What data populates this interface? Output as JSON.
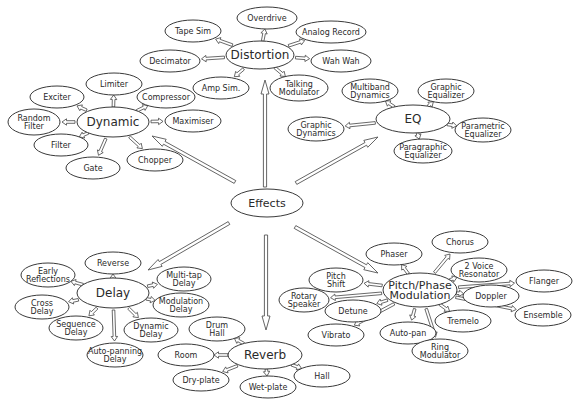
{
  "diagram": {
    "root": {
      "id": "effects",
      "label": "Effects",
      "cx": 267,
      "cy": 203,
      "rx": 36,
      "ry": 14,
      "size": 11
    },
    "groups": [
      {
        "id": "distortion",
        "label": "Distortion",
        "cx": 260,
        "cy": 55,
        "rx": 34,
        "ry": 14,
        "size": 12,
        "arrow": {
          "from": [
            265,
            187
          ],
          "to": [
            265,
            80
          ]
        },
        "children": [
          {
            "label": "Overdrive",
            "cx": 267,
            "cy": 18,
            "rx": 30,
            "ry": 11
          },
          {
            "label": "Tape Sim",
            "cx": 193,
            "cy": 31,
            "rx": 28,
            "ry": 11
          },
          {
            "label": "Analog Record",
            "cx": 331,
            "cy": 32,
            "rx": 35,
            "ry": 11
          },
          {
            "label": "Decimator",
            "cx": 170,
            "cy": 61,
            "rx": 30,
            "ry": 11
          },
          {
            "label": "Wah Wah",
            "cx": 341,
            "cy": 61,
            "rx": 30,
            "ry": 11
          },
          {
            "label": "Amp Sim.",
            "cx": 221,
            "cy": 88,
            "rx": 28,
            "ry": 11
          },
          {
            "label": "Talking|Modulator",
            "cx": 299,
            "cy": 88,
            "rx": 29,
            "ry": 13
          }
        ]
      },
      {
        "id": "dynamic",
        "label": "Dynamic",
        "cx": 113,
        "cy": 122,
        "rx": 36,
        "ry": 15,
        "size": 12,
        "arrow": {
          "from": [
            235,
            182
          ],
          "to": [
            152,
            136
          ]
        },
        "children": [
          {
            "label": "Limiter",
            "cx": 114,
            "cy": 84,
            "rx": 28,
            "ry": 11
          },
          {
            "label": "Exciter",
            "cx": 57,
            "cy": 97,
            "rx": 27,
            "ry": 11
          },
          {
            "label": "Compressor",
            "cx": 166,
            "cy": 97,
            "rx": 29,
            "ry": 11
          },
          {
            "label": "Random|Filter",
            "cx": 34,
            "cy": 122,
            "rx": 26,
            "ry": 13
          },
          {
            "label": "Maximiser",
            "cx": 193,
            "cy": 121,
            "rx": 28,
            "ry": 11
          },
          {
            "label": "Filter",
            "cx": 61,
            "cy": 145,
            "rx": 27,
            "ry": 11
          },
          {
            "label": "Chopper",
            "cx": 155,
            "cy": 160,
            "rx": 28,
            "ry": 11
          },
          {
            "label": "Gate",
            "cx": 93,
            "cy": 168,
            "rx": 27,
            "ry": 11
          }
        ]
      },
      {
        "id": "eq",
        "label": "EQ",
        "cx": 413,
        "cy": 119,
        "rx": 37,
        "ry": 14,
        "size": 12,
        "arrow": {
          "from": [
            296,
            183
          ],
          "to": [
            378,
            137
          ]
        },
        "children": [
          {
            "label": "Multiband|Dynamics",
            "cx": 370,
            "cy": 91,
            "rx": 28,
            "ry": 12
          },
          {
            "label": "Graphic|Equalizer",
            "cx": 446,
            "cy": 91,
            "rx": 28,
            "ry": 12
          },
          {
            "label": "Graphic|Dynamics",
            "cx": 316,
            "cy": 129,
            "rx": 28,
            "ry": 12
          },
          {
            "label": "Parametric|Equalizer",
            "cx": 483,
            "cy": 130,
            "rx": 28,
            "ry": 12
          },
          {
            "label": "Paragraphic|Equalizer",
            "cx": 423,
            "cy": 151,
            "rx": 29,
            "ry": 12
          }
        ]
      },
      {
        "id": "delay",
        "label": "Delay",
        "cx": 113,
        "cy": 293,
        "rx": 36,
        "ry": 15,
        "size": 12,
        "arrow": {
          "from": [
            229,
            223
          ],
          "to": [
            148,
            270
          ]
        },
        "children": [
          {
            "label": "Reverse",
            "cx": 113,
            "cy": 263,
            "rx": 28,
            "ry": 11
          },
          {
            "label": "Early|Reflections",
            "cx": 48,
            "cy": 275,
            "rx": 27,
            "ry": 12
          },
          {
            "label": "Multi-tap|Delay",
            "cx": 184,
            "cy": 279,
            "rx": 27,
            "ry": 12
          },
          {
            "label": "Cross|Delay",
            "cx": 42,
            "cy": 307,
            "rx": 27,
            "ry": 12
          },
          {
            "label": "Modulation|Delay",
            "cx": 181,
            "cy": 305,
            "rx": 28,
            "ry": 12
          },
          {
            "label": "Sequence|Delay",
            "cx": 76,
            "cy": 328,
            "rx": 27,
            "ry": 12
          },
          {
            "label": "Dynamic|Delay",
            "cx": 151,
            "cy": 330,
            "rx": 27,
            "ry": 12
          },
          {
            "label": "Auto-panning|Delay",
            "cx": 115,
            "cy": 355,
            "rx": 28,
            "ry": 12
          }
        ]
      },
      {
        "id": "reverb",
        "label": "Reverb",
        "cx": 265,
        "cy": 355,
        "rx": 37,
        "ry": 14,
        "size": 12,
        "arrow": {
          "from": [
            266,
            235
          ],
          "to": [
            266,
            330
          ]
        },
        "children": [
          {
            "label": "Drum|Hall",
            "cx": 217,
            "cy": 329,
            "rx": 28,
            "ry": 12
          },
          {
            "label": "Room",
            "cx": 186,
            "cy": 355,
            "rx": 28,
            "ry": 11
          },
          {
            "label": "Dry-plate",
            "cx": 201,
            "cy": 380,
            "rx": 28,
            "ry": 11
          },
          {
            "label": "Wet-plate",
            "cx": 268,
            "cy": 387,
            "rx": 28,
            "ry": 11
          },
          {
            "label": "Hall",
            "cx": 322,
            "cy": 376,
            "rx": 28,
            "ry": 11
          }
        ]
      },
      {
        "id": "pitch",
        "label": "Pitch/Phase|Modulation",
        "cx": 420,
        "cy": 290,
        "rx": 37,
        "ry": 17,
        "size": 11,
        "arrow": {
          "from": [
            295,
            227
          ],
          "to": [
            378,
            273
          ]
        },
        "children": [
          {
            "label": "Chorus",
            "cx": 460,
            "cy": 242,
            "rx": 28,
            "ry": 11
          },
          {
            "label": "Phaser",
            "cx": 394,
            "cy": 254,
            "rx": 28,
            "ry": 11
          },
          {
            "label": "2 Voice|Resonator",
            "cx": 479,
            "cy": 270,
            "rx": 28,
            "ry": 12
          },
          {
            "label": "Pitch|Shift",
            "cx": 336,
            "cy": 280,
            "rx": 27,
            "ry": 12
          },
          {
            "label": "Flanger",
            "cx": 544,
            "cy": 281,
            "rx": 28,
            "ry": 11
          },
          {
            "label": "Rotary|Speaker",
            "cx": 304,
            "cy": 300,
            "rx": 25,
            "ry": 12
          },
          {
            "label": "Doppler",
            "cx": 491,
            "cy": 296,
            "rx": 28,
            "ry": 11
          },
          {
            "label": "Detune",
            "cx": 353,
            "cy": 311,
            "rx": 28,
            "ry": 11
          },
          {
            "label": "Ensemble",
            "cx": 543,
            "cy": 315,
            "rx": 28,
            "ry": 11
          },
          {
            "label": "Tremelo",
            "cx": 463,
            "cy": 321,
            "rx": 28,
            "ry": 11
          },
          {
            "label": "Vibrato",
            "cx": 336,
            "cy": 335,
            "rx": 28,
            "ry": 11
          },
          {
            "label": "Auto-pan",
            "cx": 408,
            "cy": 333,
            "rx": 28,
            "ry": 11
          },
          {
            "label": "Ring|Modulator",
            "cx": 440,
            "cy": 351,
            "rx": 28,
            "ry": 12
          }
        ]
      }
    ]
  }
}
